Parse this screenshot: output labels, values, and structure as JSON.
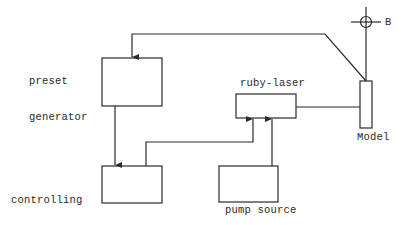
{
  "diagram": {
    "nodes": {
      "preset_generator": {
        "label_line1": "preset",
        "label_line2": "generator"
      },
      "controlling_system": {
        "label_line1": "controlling",
        "label_line2": "system"
      },
      "ruby_laser": {
        "label": "ruby-laser"
      },
      "pump_source": {
        "label": "pump source"
      },
      "model": {
        "label": "Model"
      },
      "axis_marker": {
        "label": "B"
      }
    },
    "edges": [
      {
        "from": "model",
        "to": "preset_generator"
      },
      {
        "from": "preset_generator",
        "to": "controlling_system"
      },
      {
        "from": "controlling_system",
        "to": "ruby_laser"
      },
      {
        "from": "pump_source",
        "to": "ruby_laser"
      },
      {
        "from": "ruby_laser",
        "to": "model"
      }
    ],
    "colors": {
      "stroke": "#2a2a2a",
      "background": "#ffffff"
    }
  }
}
